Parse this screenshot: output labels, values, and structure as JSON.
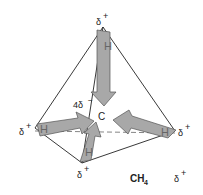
{
  "figure": {
    "formula": "CH",
    "formula_subscript": "4",
    "central_atom": "C",
    "central_charge": "4δ",
    "central_charge_sign": "−",
    "vertices": [
      {
        "id": "top",
        "atom": "H",
        "charge": "δ",
        "sign": "+"
      },
      {
        "id": "left",
        "atom": "H",
        "charge": "δ",
        "sign": "+"
      },
      {
        "id": "right",
        "atom": "H",
        "charge": "δ",
        "sign": "+"
      },
      {
        "id": "bottom",
        "atom": "H",
        "charge": "δ",
        "sign": "+"
      }
    ],
    "extra_label": {
      "charge": "δ",
      "sign": "+"
    },
    "colors": {
      "arrow_fill": "#a8a8a8",
      "arrow_stroke": "#555555",
      "edge": "#222222",
      "dashed_edge": "#777777"
    }
  }
}
